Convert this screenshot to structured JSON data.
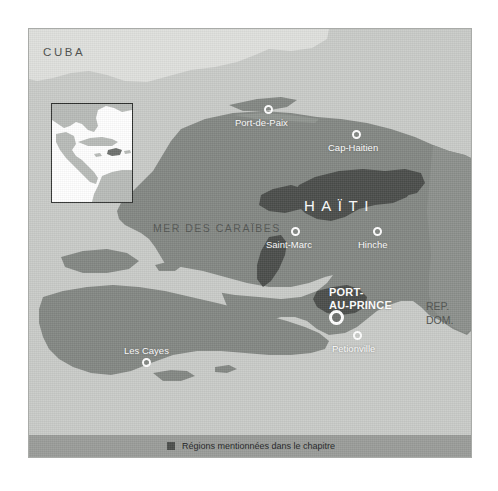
{
  "figure": {
    "kind": "reference-map",
    "region_title": "HAÏTI",
    "colors": {
      "sea": "#c9cbc8",
      "cuba_land": "#dfe0dd",
      "land": "#838783",
      "highlight_region": "#4a4d4a",
      "legend_band": "#9a9c99",
      "frame_border": "#a9aba8",
      "label_dark": "#4f524f",
      "label_light": "#ffffff"
    }
  },
  "labels": {
    "cuba": "CUBA",
    "sea": "MER DES CARAÏBES",
    "country": "HAÏTI",
    "neighbour_line1": "REP.",
    "neighbour_line2": "DOM."
  },
  "cities": [
    {
      "name": "Port-de-Paix",
      "marker": "circle-small"
    },
    {
      "name": "Cap-Haitien",
      "marker": "circle-small"
    },
    {
      "name": "Saint-Marc",
      "marker": "circle-small"
    },
    {
      "name": "Hinche",
      "marker": "circle-small"
    },
    {
      "name": "PORT-",
      "name2": "AU-PRINCE",
      "marker": "circle-capital"
    },
    {
      "name": "Petionville",
      "marker": "circle-small"
    },
    {
      "name": "Les Cayes",
      "marker": "circle-small"
    }
  ],
  "legend": {
    "swatch_color": "#4b4e4b",
    "text": "Régions mentionnées dans le chapitre"
  },
  "inset": {
    "description": "Carte de situation des Caraïbes"
  }
}
